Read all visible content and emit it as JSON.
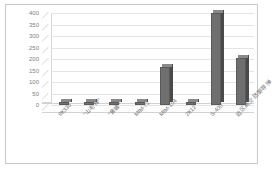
{
  "chart_data": {
    "type": "bar",
    "title": "",
    "subtitle": "",
    "xlabel": "",
    "ylabel": "",
    "categories": [
      "9К330",
      "\"山毛榉\"",
      "\"黄蜂\"",
      "MIM-72",
      "MIM-104",
      "2К12",
      "S-400",
      "远区高空防御导弹"
    ],
    "values": [
      8,
      6,
      10,
      6,
      165,
      12,
      400,
      205
    ],
    "ylim": [
      0,
      400
    ],
    "yticks": [
      "0",
      "50",
      "100",
      "150",
      "200",
      "250",
      "300",
      "350",
      "400"
    ],
    "grid": true,
    "legend": false,
    "bar_color": "#6f6f6f",
    "bar_side_color": "#4a4a4a",
    "bar_top_color": "#8a8a8a",
    "grid_color": "#e4e4e4",
    "axis_color": "#cfcfcf",
    "tick_text_color": "#808080",
    "frame_color": "#c9c9c9",
    "background": "#ffffff"
  }
}
